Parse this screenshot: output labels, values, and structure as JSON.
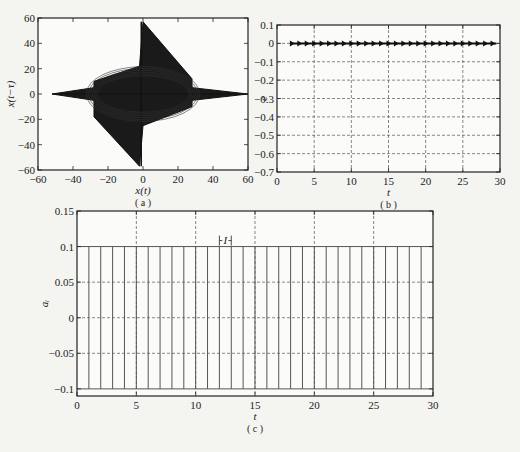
{
  "chart_data": [
    {
      "id": "a",
      "type": "line",
      "caption": "( a )",
      "title": "",
      "xlabel": "x(t)",
      "ylabel": "x(t−τ)",
      "xlim": [
        -60,
        60
      ],
      "ylim": [
        -60,
        60
      ],
      "xticks": [
        -60,
        -40,
        -20,
        0,
        20,
        40,
        60
      ],
      "yticks": [
        -60,
        -40,
        -20,
        0,
        20,
        40,
        60
      ],
      "grid": false,
      "description": "Phase portrait of chaotic delayed system: dense diamond-shaped attractor centered at origin, spanning x from about -52 to 60 and y from about -57 to 57 with spikes along axes",
      "envelope": {
        "x": [
          -52,
          -28,
          -28,
          -2,
          0,
          28,
          28,
          60,
          28,
          28,
          0,
          -2,
          -28,
          -28,
          -52
        ],
        "y": [
          0,
          5,
          10,
          22,
          57,
          12,
          5,
          0,
          -5,
          -10,
          -25,
          -57,
          -18,
          -5,
          0
        ]
      }
    },
    {
      "id": "b",
      "type": "line",
      "caption": "( b )",
      "title": "",
      "xlabel": "t",
      "ylabel": "e",
      "xlim": [
        0,
        30
      ],
      "ylim": [
        -0.7,
        0.1
      ],
      "xticks": [
        0,
        5,
        10,
        15,
        20,
        25,
        30
      ],
      "yticks": [
        0.1,
        0,
        -0.1,
        -0.2,
        -0.3,
        -0.4,
        -0.5,
        -0.6,
        -0.7
      ],
      "grid": true,
      "series": [
        {
          "name": "e",
          "x": [
            1.8,
            5,
            10,
            15,
            20,
            25,
            29.5
          ],
          "values": [
            0,
            0,
            0,
            0,
            0,
            0,
            0
          ]
        }
      ],
      "description": "Synchronization error stays near 0 from t≈1.8 to 30 with small periodic spikes"
    },
    {
      "id": "c",
      "type": "line",
      "caption": "( c )",
      "title": "",
      "xlabel": "t",
      "ylabel": "a_i",
      "xlim": [
        0,
        30
      ],
      "ylim": [
        -0.11,
        0.15
      ],
      "xticks": [
        0,
        5,
        10,
        15,
        20,
        25,
        30
      ],
      "yticks": [
        0.15,
        0.1,
        0.05,
        0,
        -0.05,
        -0.1
      ],
      "grid": true,
      "annotation": "I",
      "annotation_span": [
        12,
        13
      ],
      "series": [
        {
          "name": "a_i",
          "type": "impulse_train",
          "period": 1,
          "high": 0.1,
          "low": -0.1,
          "switch_times": [
            1,
            2,
            3,
            4,
            5,
            6,
            7,
            8,
            9,
            10,
            11,
            12,
            13,
            14,
            15,
            16,
            17,
            18,
            19,
            20,
            21,
            22,
            23,
            24,
            25,
            26,
            27,
            28,
            29
          ]
        }
      ],
      "description": "Impulsive control signal switching between 0.1 and -0.1 at each integer t (interval I = 1)"
    }
  ]
}
